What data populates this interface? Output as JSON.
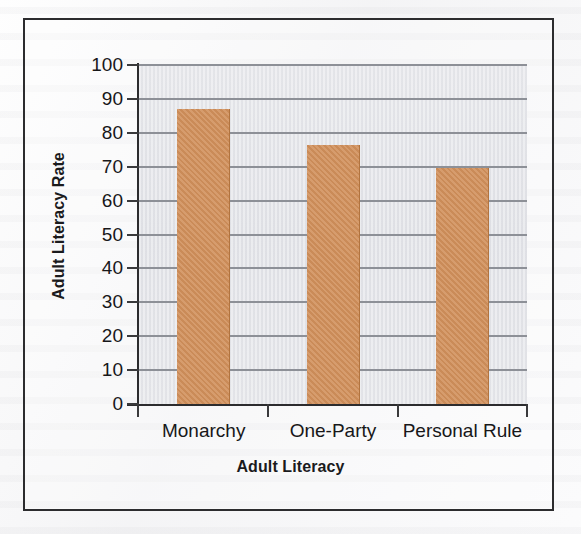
{
  "chart_data": {
    "type": "bar",
    "title": "",
    "categories": [
      "Monarchy",
      "One-Party",
      "Personal Rule"
    ],
    "values": [
      87,
      76.5,
      69.5
    ],
    "xlabel": "Adult Literacy",
    "ylabel": "Adult Literacy Rate",
    "ylim": [
      0,
      100
    ],
    "ytick_labels": [
      "100",
      "90",
      "80",
      "70",
      "60",
      "50",
      "40",
      "30",
      "20",
      "10",
      "0"
    ],
    "ytick_values": [
      100,
      90,
      80,
      70,
      60,
      50,
      40,
      30,
      20,
      10,
      0
    ],
    "grid": true,
    "legend": false,
    "legend_position": "none",
    "bar_color": "#d1905b",
    "plot_background": "#e3e4e9",
    "axis_color": "#2c2c2e",
    "gridline_color": "#8d9097",
    "page_background": "#f4f4f5"
  }
}
